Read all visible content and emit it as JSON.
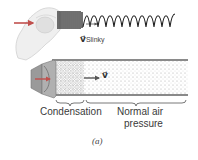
{
  "figure": {
    "top_panel": {
      "velocity_label": {
        "symbol": "v⃗",
        "subscript": "Slinky"
      },
      "arrow_color": "#c0504d"
    },
    "bottom_panel": {
      "velocity_label": {
        "symbol": "v⃗"
      },
      "region_labels": {
        "condensation": "Condensation",
        "normal_line1": "Normal air",
        "normal_line2": "pressure"
      },
      "arrow_color": "#c0504d"
    },
    "caption": "(a)"
  }
}
